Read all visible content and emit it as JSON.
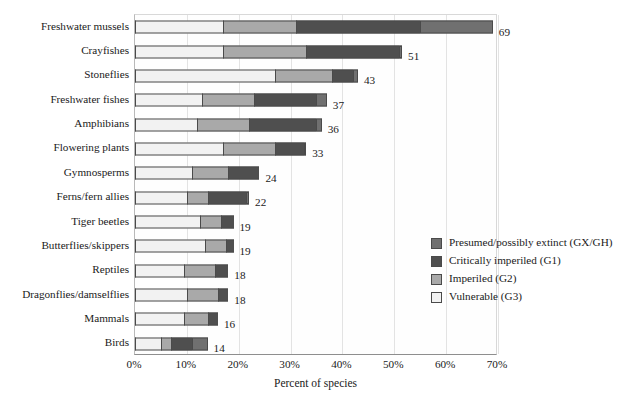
{
  "chart_data": {
    "type": "bar",
    "orientation": "horizontal",
    "stacked": true,
    "title": "",
    "xlabel": "Percent of species",
    "ylabel": "",
    "xlim": [
      0,
      70
    ],
    "xtick_labels": [
      "0%",
      "10%",
      "20%",
      "30%",
      "40%",
      "50%",
      "60%",
      "70%"
    ],
    "xtick_values": [
      0,
      10,
      20,
      30,
      40,
      50,
      60,
      70
    ],
    "grid": "vertical",
    "legend_position": "middle-right inside plot",
    "categories": [
      "Freshwater mussels",
      "Crayfishes",
      "Stoneflies",
      "Freshwater fishes",
      "Amphibians",
      "Flowering plants",
      "Gymnosperms",
      "Ferns/fern allies",
      "Tiger beetles",
      "Butterflies/skippers",
      "Reptiles",
      "Dragonflies/damselflies",
      "Mammals",
      "Birds"
    ],
    "series": [
      {
        "name": "Vulnerable (G3)",
        "code": "G3",
        "color": "#f2f2f2",
        "values": [
          17,
          17,
          27,
          13,
          12,
          17,
          11,
          10,
          12.5,
          13.5,
          9.5,
          10,
          9.5,
          5
        ]
      },
      {
        "name": "Imperiled (G2)",
        "code": "G2",
        "color": "#a9a9a9",
        "values": [
          14,
          16,
          11,
          10,
          10,
          10,
          7,
          4,
          4,
          4,
          6,
          6,
          4.5,
          2
        ]
      },
      {
        "name": "Critically imperiled (G1)",
        "code": "G1",
        "color": "#4f4f4f",
        "values": [
          24,
          18,
          4,
          12,
          13,
          5.5,
          6,
          7.5,
          2.5,
          1.5,
          2.5,
          2,
          2,
          4
        ]
      },
      {
        "name": "Presumed/possibly extinct (GX/GH)",
        "code": "GX/GH",
        "color": "#707070",
        "values": [
          14,
          0.5,
          1,
          2,
          1,
          0.5,
          0,
          0.5,
          0,
          0,
          0,
          0,
          0,
          3
        ]
      }
    ],
    "totals": [
      69,
      51,
      43,
      37,
      36,
      33,
      24,
      22,
      19,
      19,
      18,
      18,
      16,
      14
    ],
    "total_labels": [
      "69",
      "51",
      "43",
      "37",
      "36",
      "33",
      "24",
      "22",
      "19",
      "19",
      "18",
      "18",
      "16",
      "14"
    ]
  },
  "legend": {
    "items": [
      {
        "label": "Presumed/possibly extinct (GX/GH)",
        "color": "#707070",
        "swatch_name": "legend-swatch-gx-gh"
      },
      {
        "label": "Critically imperiled (G1)",
        "color": "#4f4f4f",
        "swatch_name": "legend-swatch-g1"
      },
      {
        "label": "Imperiled (G2)",
        "color": "#a9a9a9",
        "swatch_name": "legend-swatch-g2"
      },
      {
        "label": "Vulnerable (G3)",
        "color": "#f2f2f2",
        "swatch_name": "legend-swatch-g3"
      }
    ]
  }
}
